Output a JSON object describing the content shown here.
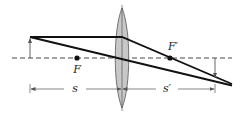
{
  "diagram": {
    "type": "thin-lens-ray-diagram",
    "colors": {
      "ray": "#111111",
      "axis": "#333333",
      "lens_fill": "#c8c8c8",
      "lens_stroke": "#555555",
      "dimension": "#555555",
      "arrow": "#555555",
      "background": "#ffffff"
    },
    "labels": {
      "focal_point_object_side": "F",
      "focal_point_image_side": "F′",
      "object_distance": "s",
      "image_distance": "s′"
    }
  }
}
